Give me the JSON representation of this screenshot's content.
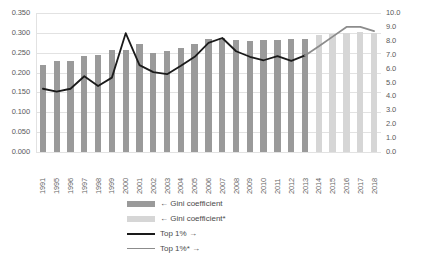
{
  "chart_data": {
    "type": "bar",
    "title": "",
    "xlabel": "",
    "ylabel": "",
    "grid": true,
    "legend_position": "bottom-center",
    "categories": [
      "1991",
      "1995",
      "1996",
      "1997",
      "1998",
      "1999",
      "2000",
      "2001",
      "2002",
      "2003",
      "2004",
      "2005",
      "2006",
      "2007",
      "2008",
      "2009",
      "2010",
      "2011",
      "2012",
      "2013",
      "2014",
      "2015",
      "2016",
      "2017",
      "2018"
    ],
    "left_axis": {
      "label": "Gini coefficient",
      "min": 0.0,
      "max": 0.35,
      "step": 0.05,
      "ticks": [
        "0.000",
        "0.050",
        "0.100",
        "0.150",
        "0.200",
        "0.250",
        "0.300",
        "0.350"
      ]
    },
    "right_axis": {
      "label": "Top 1%",
      "min": 0.0,
      "max": 10.0,
      "step": 1.0,
      "ticks": [
        "0.0",
        "1.0",
        "2.0",
        "3.0",
        "4.0",
        "5.0",
        "6.0",
        "7.0",
        "8.0",
        "9.0",
        "10.0"
      ]
    },
    "series": [
      {
        "name": "← Gini coefficient",
        "key": "gini",
        "type": "bar",
        "axis": "left",
        "color": "#9a9a9a",
        "values": [
          0.22,
          0.228,
          0.23,
          0.242,
          0.245,
          0.258,
          0.258,
          0.272,
          0.25,
          0.255,
          0.262,
          0.272,
          0.285,
          0.288,
          0.283,
          0.28,
          0.283,
          0.283,
          0.285,
          0.285,
          null,
          null,
          null,
          null,
          null
        ]
      },
      {
        "name": "← Gini coefficient*",
        "key": "gini_star",
        "type": "bar",
        "axis": "left",
        "color": "#d6d6d6",
        "values": [
          null,
          null,
          null,
          null,
          null,
          null,
          null,
          null,
          null,
          null,
          null,
          null,
          null,
          null,
          null,
          null,
          null,
          null,
          null,
          null,
          0.295,
          0.298,
          0.3,
          0.302,
          0.3
        ]
      },
      {
        "name": "Top 1% →",
        "key": "top1",
        "type": "line",
        "axis": "right",
        "color": "#1a1a1a",
        "values": [
          4.55,
          4.35,
          4.55,
          5.45,
          4.75,
          5.35,
          8.55,
          6.25,
          5.75,
          5.6,
          6.2,
          6.85,
          7.85,
          8.2,
          7.25,
          6.85,
          6.6,
          6.9,
          6.55,
          6.95,
          null,
          null,
          null,
          null,
          null
        ]
      },
      {
        "name": "Top 1%* →",
        "key": "top1_star",
        "type": "line",
        "axis": "right",
        "color": "#8c8c8c",
        "values": [
          null,
          null,
          null,
          null,
          null,
          null,
          null,
          null,
          null,
          null,
          null,
          null,
          null,
          null,
          null,
          null,
          null,
          null,
          null,
          6.95,
          7.6,
          8.3,
          9.0,
          9.0,
          8.7
        ]
      }
    ]
  },
  "legend": {
    "items": [
      {
        "label": "← Gini coefficient",
        "marker": "bar",
        "color": "#9a9a9a"
      },
      {
        "label": "← Gini coefficient*",
        "marker": "bar",
        "color": "#d6d6d6"
      },
      {
        "label": "Top 1% →",
        "marker": "line",
        "color": "#1a1a1a"
      },
      {
        "label": "Top 1%* →",
        "marker": "line",
        "color": "#8c8c8c"
      }
    ]
  }
}
